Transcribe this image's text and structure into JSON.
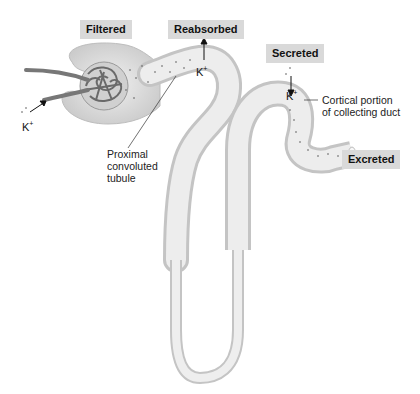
{
  "diagram": {
    "stage_labels": {
      "filtered": "Filtered",
      "reabsorbed": "Reabsorbed",
      "secreted": "Secreted",
      "excreted": "Excreted"
    },
    "annotations": {
      "proximal_line1": "Proximal",
      "proximal_line2": "convoluted",
      "proximal_line3": "tubule",
      "cortical_line1": "Cortical portion",
      "cortical_line2": "of collecting duct"
    },
    "ion": {
      "symbol": "K",
      "charge": "+"
    },
    "colors": {
      "tubule_fill": "#e6e6e6",
      "tubule_edge": "#bdbdbd",
      "label_bg": "#d9d9d9",
      "vessel": "#7a7a7a"
    }
  }
}
